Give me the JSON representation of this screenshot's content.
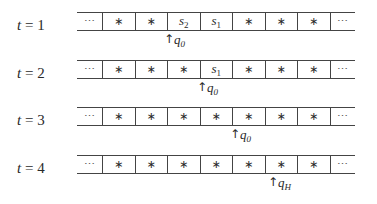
{
  "diagram": {
    "type": "turing-machine-tape-evolution",
    "rows": [
      {
        "label": {
          "var": "t",
          "eq": " = ",
          "value": "1"
        },
        "cells": [
          {
            "base": "⋯",
            "sub": ""
          },
          {
            "base": "∗",
            "sub": ""
          },
          {
            "base": "∗",
            "sub": ""
          },
          {
            "base": "s",
            "sub": "2"
          },
          {
            "base": "s",
            "sub": "1"
          },
          {
            "base": "∗",
            "sub": ""
          },
          {
            "base": "∗",
            "sub": ""
          },
          {
            "base": "∗",
            "sub": ""
          },
          {
            "base": "⋯",
            "sub": ""
          }
        ],
        "head": {
          "arrow": "↑",
          "state": "q",
          "state_sub": "0",
          "cell_index": 3
        }
      },
      {
        "label": {
          "var": "t",
          "eq": " = ",
          "value": "2"
        },
        "cells": [
          {
            "base": "⋯",
            "sub": ""
          },
          {
            "base": "∗",
            "sub": ""
          },
          {
            "base": "∗",
            "sub": ""
          },
          {
            "base": "∗",
            "sub": ""
          },
          {
            "base": "s",
            "sub": "1"
          },
          {
            "base": "∗",
            "sub": ""
          },
          {
            "base": "∗",
            "sub": ""
          },
          {
            "base": "∗",
            "sub": ""
          },
          {
            "base": "⋯",
            "sub": ""
          }
        ],
        "head": {
          "arrow": "↑",
          "state": "q",
          "state_sub": "0",
          "cell_index": 4
        }
      },
      {
        "label": {
          "var": "t",
          "eq": " = ",
          "value": "3"
        },
        "cells": [
          {
            "base": "⋯",
            "sub": ""
          },
          {
            "base": "∗",
            "sub": ""
          },
          {
            "base": "∗",
            "sub": ""
          },
          {
            "base": "∗",
            "sub": ""
          },
          {
            "base": "∗",
            "sub": ""
          },
          {
            "base": "∗",
            "sub": ""
          },
          {
            "base": "∗",
            "sub": ""
          },
          {
            "base": "∗",
            "sub": ""
          },
          {
            "base": "⋯",
            "sub": ""
          }
        ],
        "head": {
          "arrow": "↑",
          "state": "q",
          "state_sub": "0",
          "cell_index": 5
        }
      },
      {
        "label": {
          "var": "t",
          "eq": " = ",
          "value": "4"
        },
        "cells": [
          {
            "base": "⋯",
            "sub": ""
          },
          {
            "base": "∗",
            "sub": ""
          },
          {
            "base": "∗",
            "sub": ""
          },
          {
            "base": "∗",
            "sub": ""
          },
          {
            "base": "∗",
            "sub": ""
          },
          {
            "base": "∗",
            "sub": ""
          },
          {
            "base": "∗",
            "sub": ""
          },
          {
            "base": "∗",
            "sub": ""
          },
          {
            "base": "⋯",
            "sub": ""
          }
        ],
        "head": {
          "arrow": "↑",
          "state": "q",
          "state_sub": "H",
          "cell_index": 6
        }
      }
    ]
  }
}
